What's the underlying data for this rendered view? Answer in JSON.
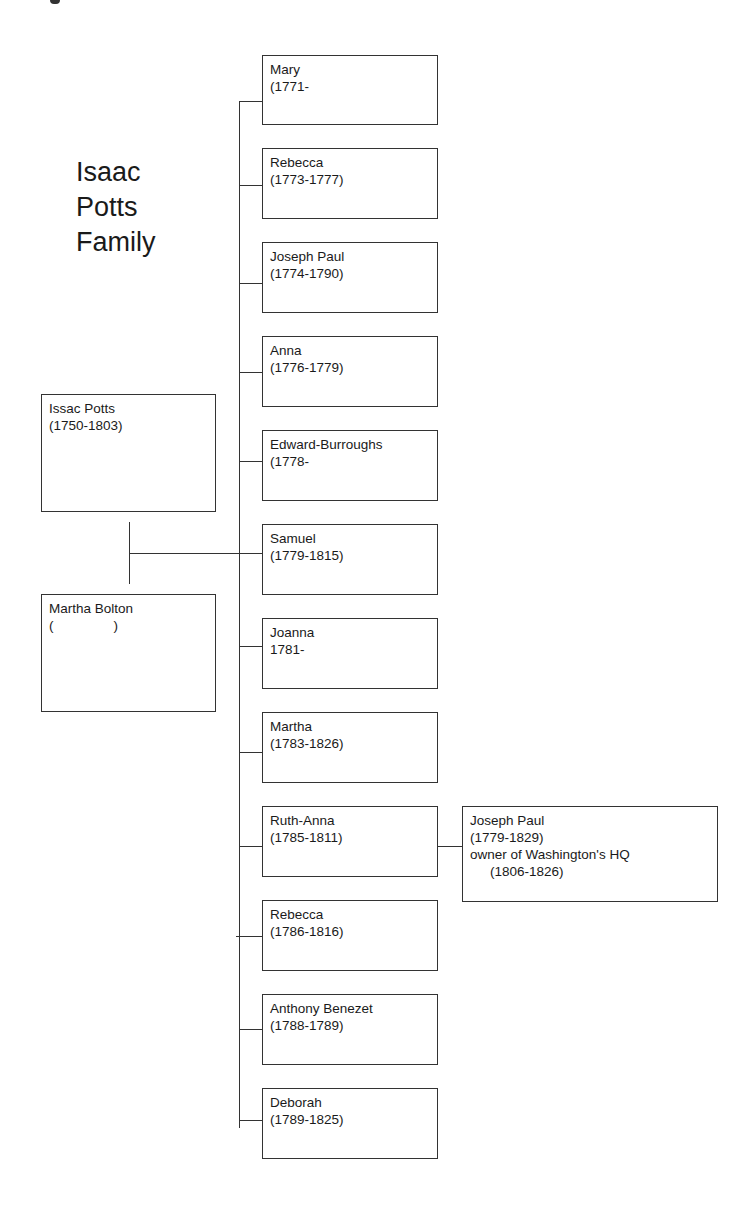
{
  "title": {
    "lines": [
      "Isaac",
      "Potts",
      "Family"
    ]
  },
  "parents": {
    "father": {
      "name": "Issac Potts",
      "dates": "(1750-1803)"
    },
    "mother": {
      "name": "Martha Bolton",
      "dates": "(                )"
    }
  },
  "children": [
    {
      "name": "Mary",
      "dates": "(1771-"
    },
    {
      "name": "Rebecca",
      "dates": "(1773-1777)"
    },
    {
      "name": "Joseph Paul",
      "dates": "(1774-1790)"
    },
    {
      "name": "Anna",
      "dates": "(1776-1779)"
    },
    {
      "name": "Edward-Burroughs",
      "dates": "(1778-"
    },
    {
      "name": "Samuel",
      "dates": "(1779-1815)"
    },
    {
      "name": "Joanna",
      "dates": "1781-"
    },
    {
      "name": "Martha",
      "dates": "(1783-1826)"
    },
    {
      "name": "Ruth-Anna",
      "dates": "(1785-1811)"
    },
    {
      "name": "Rebecca",
      "dates": "(1786-1816)"
    },
    {
      "name": "Anthony Benezet",
      "dates": "(1788-1789)"
    },
    {
      "name": "Deborah",
      "dates": "(1789-1825)"
    }
  ],
  "spouse_of_ruth_anna": {
    "name": "Joseph Paul",
    "dates": "(1779-1829)",
    "note": "owner of Washington's HQ",
    "note_dates": "(1806-1826)"
  },
  "colors": {
    "line": "#333333",
    "background": "#ffffff",
    "text": "#1a1a1a"
  }
}
